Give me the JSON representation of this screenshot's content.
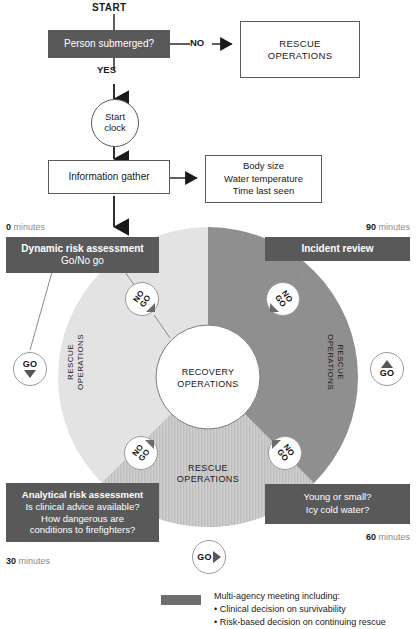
{
  "diagram": {
    "title_start": "START",
    "nodes": {
      "person_submerged": "Person submerged?",
      "rescue_operations_top": "RESCUE\nOPERATIONS",
      "start_clock": "Start\nclock",
      "information_gather": "Information gather",
      "info_details": "Body size\nWater temperature\nTime last seen",
      "dynamic_risk_title": "Dynamic risk assessment",
      "dynamic_risk_sub": "Go/No go",
      "incident_review": "Incident review",
      "analytical_title": "Analytical risk assessment",
      "analytical_line1": "Is clinical advice available?",
      "analytical_line2": "How dangerous are",
      "analytical_line3": "conditions to firefighters?",
      "young_small_line1": "Young or small?",
      "young_small_line2": "Icy cold water?",
      "recovery_operations": "RECOVERY\nOPERATIONS"
    },
    "edge_labels": {
      "no": "NO",
      "yes": "YES"
    },
    "arc_labels": {
      "left": "RESCUE\nOPERATIONS",
      "right": "RESCUE\nOPERATIONS",
      "bottom": "RESCUE\nOPERATIONS"
    },
    "badges": [
      {
        "name": "go-left",
        "text": "GO",
        "direction": "down"
      },
      {
        "name": "no-go-top-left",
        "text": "NO\nGO",
        "direction": "down-right"
      },
      {
        "name": "no-go-top-right",
        "text": "NO\nGO",
        "direction": "down-left"
      },
      {
        "name": "go-right",
        "text": "GO",
        "direction": "up"
      },
      {
        "name": "no-go-bottom-left",
        "text": "NO\nGO",
        "direction": "up-right"
      },
      {
        "name": "no-go-bottom-right",
        "text": "NO\nGO",
        "direction": "up-left"
      },
      {
        "name": "go-bottom",
        "text": "GO",
        "direction": "right"
      }
    ],
    "timeline": [
      {
        "name": "t-0",
        "value": "0",
        "unit": "minutes"
      },
      {
        "name": "t-90",
        "value": "90",
        "unit": "minutes"
      },
      {
        "name": "t-30",
        "value": "30",
        "unit": "minutes"
      },
      {
        "name": "t-60",
        "value": "60",
        "unit": "minutes"
      }
    ],
    "legend": {
      "heading": "Multi-agency meeting including:",
      "bullet1": "• Clinical decision on survivability",
      "bullet2": "• Risk-based decision on continuing rescue"
    },
    "colors": {
      "dark_gray": "#595959",
      "mid_gray": "#6e6e6e",
      "arc_light": "#e0e0e0",
      "arc_dark": "#8f8f8f",
      "arc_hatch": "#c0c0c0",
      "white": "#ffffff",
      "text": "#1a1a1a",
      "muted": "#8c8c8c"
    }
  }
}
